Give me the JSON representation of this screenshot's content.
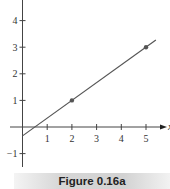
{
  "chart_data": {
    "type": "line",
    "title": "",
    "xlabel": "x",
    "ylabel": "",
    "xlim": [
      -0.5,
      5.8
    ],
    "ylim": [
      -1.5,
      4.8
    ],
    "x_ticks": [
      1,
      2,
      3,
      4,
      5
    ],
    "y_ticks": [
      -1,
      1,
      2,
      3,
      4
    ],
    "grid": false,
    "series": [
      {
        "name": "line",
        "x": [
          0,
          5.4
        ],
        "y": [
          -0.3333,
          3.2667
        ],
        "slope": 0.6667,
        "intercept": -0.3333
      }
    ],
    "points": [
      {
        "x": 2,
        "y": 1
      },
      {
        "x": 5,
        "y": 3
      }
    ]
  },
  "caption": "Figure 0.16a",
  "colors": {
    "axis": "#444444",
    "line": "#555555",
    "point": "#555555"
  }
}
